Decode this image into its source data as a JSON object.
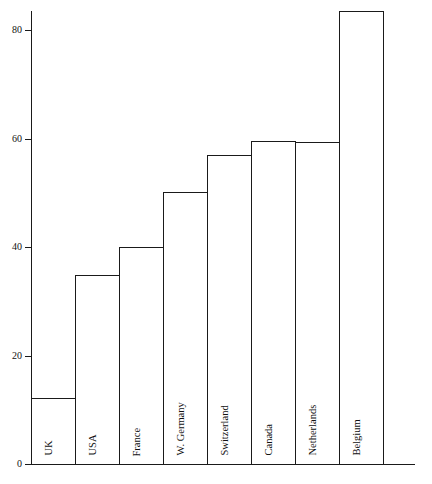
{
  "chart": {
    "type": "bar",
    "title": "",
    "xlabel": "",
    "ylabel": "",
    "y_ticks": [
      "0",
      "20",
      "40",
      "60",
      "80"
    ],
    "axis_color": "#1a1a1a",
    "grid": false,
    "legend": "none",
    "note_clipped_bar": "Belgium"
  },
  "chart_data": {
    "type": "bar",
    "title": "",
    "xlabel": "",
    "ylabel": "",
    "categories": [
      "UK",
      "USA",
      "France",
      "W. Germany",
      "Switzerland",
      "Canada",
      "Netherlands",
      "Belgium"
    ],
    "values": [
      12.2,
      34.8,
      40.0,
      50.1,
      57.0,
      59.5,
      59.4,
      83.5
    ],
    "ylim": [
      0,
      80
    ],
    "ytick_values": [
      0,
      20,
      40,
      60,
      80
    ],
    "ytick_labels": [
      "0",
      "20",
      "40",
      "60",
      "80"
    ],
    "grid": false,
    "legend": "none",
    "bar_fill": "none",
    "bar_edge_color": "#1a1a1a"
  },
  "ticks": [
    {
      "label": "80",
      "value": 80
    },
    {
      "label": "60",
      "value": 60
    },
    {
      "label": "40",
      "value": 40
    },
    {
      "label": "20",
      "value": 20
    },
    {
      "label": "0",
      "value": 0
    }
  ],
  "bars": [
    {
      "label": "UK",
      "value": 12.2
    },
    {
      "label": "USA",
      "value": 34.8
    },
    {
      "label": "France",
      "value": 40.0
    },
    {
      "label": "W. Germany",
      "value": 50.1
    },
    {
      "label": "Switzerland",
      "value": 57.0
    },
    {
      "label": "Canada",
      "value": 59.5
    },
    {
      "label": "Netherlands",
      "value": 59.4
    },
    {
      "label": "Belgium",
      "value": 83.5
    }
  ]
}
